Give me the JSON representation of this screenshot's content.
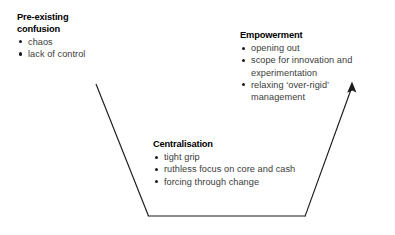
{
  "diagram": {
    "type": "funnel-process-diagram",
    "background_color": "#ffffff",
    "line_color": "#1a1a1a",
    "heading_color": "#000000",
    "body_color": "#3b3b3b",
    "blocks": [
      {
        "id": "pre-existing-confusion",
        "heading": "Pre-existing\nconfusion",
        "bullets": [
          "chaos",
          "lack of control"
        ]
      },
      {
        "id": "empowerment",
        "heading": "Empowerment",
        "bullets": [
          "opening out",
          "scope for innovation and experimentation",
          "relaxing ‘over-rigid’ management"
        ]
      },
      {
        "id": "centralisation",
        "heading": "Centralisation",
        "bullets": [
          "tight grip",
          "ruthless focus on core and cash",
          "forcing through change"
        ]
      }
    ],
    "shape": {
      "name": "funnel",
      "left_line": {
        "x1": 96,
        "y1": 84,
        "x2": 148,
        "y2": 216
      },
      "bottom_line": {
        "x1": 148,
        "y1": 216,
        "x2": 305,
        "y2": 216
      },
      "right_line": {
        "x1": 305,
        "y1": 216,
        "x2": 352,
        "y2": 86
      },
      "arrow_head": {
        "x": 352,
        "y": 82,
        "direction": "up-right"
      }
    }
  }
}
